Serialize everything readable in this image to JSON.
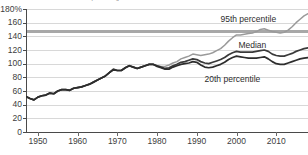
{
  "chart_data": {
    "type": "line",
    "title": "as a percentage of",
    "xlabel": "",
    "ylabel": "",
    "ylim": [
      0,
      180
    ],
    "xlim": [
      1947,
      2018
    ],
    "grid": true,
    "legend_position": "inline-right",
    "ytick_labels": [
      "180%",
      "160",
      "140",
      "120",
      "100",
      "80",
      "60",
      "40",
      "20",
      "0"
    ],
    "ytick_values": [
      180,
      160,
      140,
      120,
      100,
      80,
      60,
      40,
      20,
      0
    ],
    "xtick_labels": [
      "1950",
      "1960",
      "1970",
      "1980",
      "1990",
      "2000",
      "2010"
    ],
    "xtick_values": [
      1950,
      1960,
      1970,
      1980,
      1990,
      2000,
      2010
    ],
    "reference_line": {
      "label": "",
      "value": 148,
      "color": "#a8a8a8"
    },
    "x": [
      1947,
      1948,
      1949,
      1950,
      1951,
      1952,
      1953,
      1954,
      1955,
      1956,
      1957,
      1958,
      1959,
      1960,
      1961,
      1962,
      1963,
      1964,
      1965,
      1966,
      1967,
      1968,
      1969,
      1970,
      1971,
      1972,
      1973,
      1974,
      1975,
      1976,
      1977,
      1978,
      1979,
      1980,
      1981,
      1982,
      1983,
      1984,
      1985,
      1986,
      1987,
      1988,
      1989,
      1990,
      1991,
      1992,
      1993,
      1994,
      1995,
      1996,
      1997,
      1998,
      1999,
      2000,
      2001,
      2002,
      2003,
      2004,
      2005,
      2006,
      2007,
      2008,
      2009,
      2010,
      2011,
      2012,
      2013,
      2014,
      2015,
      2016,
      2017,
      2018
    ],
    "series": [
      {
        "name": "95th percentile",
        "color": "#9a9a9a",
        "label_x": 2003,
        "label_y": 166,
        "values": [
          52,
          49,
          47,
          51,
          53,
          54,
          57,
          56,
          60,
          62,
          62,
          61,
          64,
          65,
          66,
          68,
          70,
          73,
          76,
          79,
          82,
          87,
          91,
          90,
          90,
          94,
          97,
          95,
          93,
          95,
          97,
          99,
          99,
          97,
          96,
          96,
          98,
          101,
          103,
          107,
          109,
          111,
          114,
          113,
          112,
          113,
          114,
          116,
          119,
          122,
          127,
          133,
          138,
          142,
          142,
          143,
          144,
          145,
          147,
          150,
          151,
          149,
          147,
          146,
          145,
          146,
          149,
          154,
          160,
          165,
          170,
          173
        ]
      },
      {
        "name": "Median",
        "color": "#3a3a3a",
        "label_x": 2004,
        "label_y": 128,
        "values": [
          52,
          49,
          47,
          51,
          53,
          54,
          57,
          56,
          60,
          62,
          62,
          61,
          64,
          65,
          66,
          68,
          70,
          73,
          76,
          79,
          82,
          87,
          92,
          90,
          90,
          94,
          97,
          95,
          93,
          95,
          97,
          99,
          99,
          97,
          95,
          93,
          94,
          97,
          99,
          102,
          103,
          105,
          107,
          106,
          103,
          101,
          100,
          102,
          104,
          106,
          109,
          113,
          116,
          118,
          117,
          117,
          117,
          117,
          118,
          119,
          120,
          118,
          114,
          112,
          111,
          111,
          113,
          115,
          118,
          120,
          122,
          123
        ]
      },
      {
        "name": "20th percentile",
        "color": "#2d2d2d",
        "label_x": 1999,
        "label_y": 78,
        "values": [
          52,
          49,
          47,
          51,
          53,
          54,
          57,
          56,
          60,
          62,
          62,
          61,
          64,
          65,
          66,
          68,
          70,
          73,
          76,
          79,
          82,
          87,
          91,
          90,
          90,
          94,
          97,
          95,
          93,
          95,
          97,
          99,
          99,
          96,
          94,
          92,
          92,
          95,
          97,
          99,
          100,
          101,
          103,
          102,
          98,
          95,
          94,
          95,
          97,
          99,
          102,
          106,
          109,
          111,
          110,
          109,
          108,
          108,
          108,
          109,
          110,
          107,
          103,
          100,
          99,
          99,
          101,
          103,
          105,
          107,
          108,
          109
        ]
      }
    ]
  },
  "labels": {
    "p95": "95th percentile",
    "median": "Median",
    "p20": "20th percentile"
  }
}
